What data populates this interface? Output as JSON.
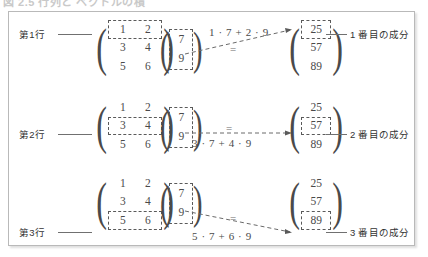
{
  "caption": {
    "text": "図 2.5  行列と ベクトルの積"
  },
  "figure": {
    "matrix_a": {
      "name": "matrix-a",
      "rows": [
        [
          "1",
          "2"
        ],
        [
          "3",
          "4"
        ],
        [
          "5",
          "6"
        ]
      ]
    },
    "vector_x": {
      "name": "vector-x",
      "values": [
        "7",
        "9"
      ]
    },
    "result_b": {
      "name": "result-vector",
      "values": [
        "25",
        "57",
        "89"
      ]
    },
    "rows": [
      {
        "row_label": "第1行",
        "highlight_matrix_row_index": 0,
        "expression": "1 · 7 + 2 · 9",
        "equals": "=",
        "highlight_result_index": 0,
        "component_label": "1 番目の成分"
      },
      {
        "row_label": "第2行",
        "highlight_matrix_row_index": 1,
        "expression": "3 · 7 + 4 · 9",
        "equals": "=",
        "highlight_result_index": 1,
        "component_label": "2 番目の成分"
      },
      {
        "row_label": "第3行",
        "highlight_matrix_row_index": 2,
        "expression": "5 · 7 + 6 · 9",
        "equals": "=",
        "highlight_result_index": 2,
        "component_label": "3 番目の成分"
      }
    ],
    "paren_left": "(",
    "paren_right": ")"
  },
  "colors": {
    "frame_border": "#b9b9b9",
    "text": "#3b3b3b",
    "math_text": "#4a4a4a",
    "dash_highlight": "#5a5a5a",
    "leader_line": "#707070",
    "background": "#ffffff"
  }
}
